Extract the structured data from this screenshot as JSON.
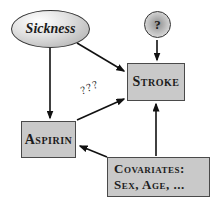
{
  "diagram": {
    "nodes": {
      "sickness": {
        "label": "Sickness",
        "shape": "ellipse"
      },
      "unknown": {
        "label": "?",
        "shape": "circle"
      },
      "stroke": {
        "label": "Stroke",
        "shape": "rect"
      },
      "aspirin": {
        "label": "Aspirin",
        "shape": "rect"
      },
      "covariates": {
        "label_line1": "Covariates:",
        "label_line2": "Sex, Age, ...",
        "shape": "rect"
      }
    },
    "edges": [
      {
        "from": "sickness",
        "to": "aspirin",
        "label": ""
      },
      {
        "from": "sickness",
        "to": "stroke",
        "label": ""
      },
      {
        "from": "unknown",
        "to": "stroke",
        "label": ""
      },
      {
        "from": "aspirin",
        "to": "stroke",
        "label": "???"
      },
      {
        "from": "covariates",
        "to": "stroke",
        "label": ""
      },
      {
        "from": "covariates",
        "to": "aspirin",
        "label": ""
      }
    ],
    "colors": {
      "node_fill": "#c9c9c9",
      "node_border": "#4a4a4a",
      "arrow": "#111111",
      "background": "#ffffff"
    }
  }
}
